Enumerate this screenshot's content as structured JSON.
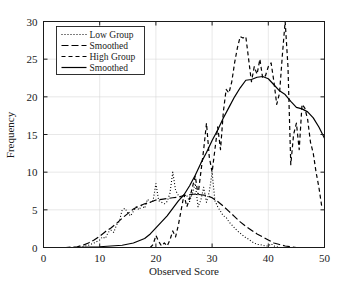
{
  "chart_data": {
    "type": "line",
    "title": "",
    "xlabel": "Observed Score",
    "ylabel": "Frequency",
    "xlim": [
      0,
      50
    ],
    "ylim": [
      0,
      30
    ],
    "xticks": [
      0,
      10,
      20,
      30,
      40,
      50
    ],
    "yticks": [
      0,
      5,
      10,
      15,
      20,
      25,
      30
    ],
    "grid": true,
    "legend_position": "top-left",
    "line_color": "#000000",
    "background_color": "#ffffff",
    "series": [
      {
        "name": "Low Group",
        "style": "dotted",
        "x": [
          0,
          1,
          2,
          3,
          4,
          5,
          6,
          7,
          8,
          9,
          10,
          10.5,
          11,
          11.5,
          12,
          12.5,
          13,
          13.5,
          14,
          14.5,
          15,
          15.5,
          16,
          16.5,
          17,
          17.5,
          18,
          18.5,
          19,
          19.5,
          20,
          20.5,
          21,
          21.5,
          22,
          22.5,
          23,
          23.5,
          24,
          24.5,
          25,
          25.5,
          26,
          26.5,
          27,
          27.5,
          28,
          28.5,
          29,
          29.5,
          30,
          30.5,
          31,
          31.5,
          32,
          32.5,
          33,
          33.5,
          34,
          34.5,
          35,
          35.5,
          36,
          36.5,
          37,
          37.5,
          38,
          38.5,
          39,
          39.5,
          40,
          40.5,
          41,
          42,
          43,
          44,
          45,
          46,
          47,
          48,
          49,
          50
        ],
        "values": [
          0,
          0,
          0,
          0,
          0,
          0,
          0,
          0.1,
          0.3,
          0.6,
          1.0,
          1.4,
          1.2,
          2.0,
          2.3,
          2.0,
          3.0,
          3.5,
          5.0,
          5.2,
          4.6,
          4.2,
          4.8,
          5.4,
          5.0,
          5.6,
          5.2,
          6.4,
          6.0,
          6.2,
          8.5,
          6.2,
          6.0,
          5.8,
          6.1,
          7.2,
          10.0,
          7.6,
          6.9,
          6.6,
          7.0,
          6.9,
          6.1,
          7.2,
          8.5,
          5.4,
          6.3,
          8.0,
          6.0,
          7.4,
          10.0,
          6.2,
          5.4,
          4.8,
          4.2,
          4.0,
          3.4,
          3.0,
          2.6,
          2.2,
          1.9,
          1.6,
          1.3,
          1.1,
          0.8,
          0.6,
          0.4,
          0.4,
          0.3,
          0.2,
          0.2,
          0.5,
          0.2,
          0,
          0,
          0,
          0,
          0,
          0,
          0,
          0,
          0
        ]
      },
      {
        "name": "Smoothed",
        "style": "long-dash",
        "x": [
          0,
          2,
          4,
          6,
          7,
          8,
          9,
          10,
          11,
          12,
          13,
          14,
          15,
          16,
          17,
          18,
          19,
          20,
          21,
          22,
          23,
          24,
          25,
          26,
          27,
          28,
          29,
          30,
          31,
          32,
          33,
          34,
          35,
          36,
          37,
          38,
          39,
          40,
          41,
          42,
          43,
          44,
          45,
          46,
          48,
          50
        ],
        "values": [
          0,
          0,
          0,
          0.1,
          0.3,
          0.6,
          1.0,
          1.5,
          2.1,
          2.6,
          3.2,
          3.9,
          4.5,
          5.1,
          5.5,
          5.8,
          6.0,
          6.3,
          6.4,
          6.5,
          6.6,
          6.7,
          6.9,
          7.0,
          7.1,
          7.0,
          6.9,
          6.6,
          6.1,
          5.5,
          4.8,
          4.1,
          3.4,
          2.8,
          2.3,
          1.8,
          1.4,
          1.0,
          0.6,
          0.4,
          0.2,
          0.1,
          0,
          0,
          0,
          0
        ]
      },
      {
        "name": "High Group",
        "style": "dash",
        "x": [
          19,
          19.5,
          20,
          20.5,
          21,
          21.5,
          22,
          22.5,
          23,
          23.5,
          24,
          24.5,
          25,
          25.5,
          26,
          26.5,
          27,
          27.5,
          28,
          28.5,
          29,
          29.5,
          30,
          30.5,
          31,
          31.5,
          32,
          32.5,
          33,
          33.5,
          34,
          34.5,
          35,
          35.5,
          36,
          36.5,
          37,
          37.5,
          38,
          38.5,
          39,
          39.5,
          40,
          40.5,
          41,
          41.5,
          42,
          42.5,
          43,
          43.5,
          44,
          44.5,
          45,
          45.5,
          46,
          46.5,
          47,
          47.5,
          48,
          48.5,
          49,
          49.5,
          50
        ],
        "values": [
          0,
          0.4,
          1.6,
          0.8,
          0.2,
          0.6,
          0.2,
          1.0,
          2.2,
          1.4,
          3.0,
          5.0,
          7.0,
          5.4,
          6.5,
          8.0,
          9.5,
          7.0,
          10.0,
          13.0,
          16.5,
          12.0,
          10.0,
          13.0,
          16.0,
          13.0,
          18.0,
          21.0,
          20.5,
          22.0,
          24.5,
          26.5,
          28.0,
          27.8,
          28.0,
          25.0,
          22.0,
          24.0,
          23.0,
          25.0,
          22.5,
          22.8,
          24.0,
          24.5,
          22.0,
          19.0,
          20.5,
          25.5,
          30.0,
          24.0,
          11.0,
          15.0,
          16.5,
          13.0,
          19.0,
          18.5,
          17.0,
          14.0,
          12.5,
          10.0,
          8.0,
          5.5,
          5.5
        ]
      },
      {
        "name": "Smoothed",
        "style": "solid",
        "x": [
          0,
          5,
          10,
          14,
          16,
          18,
          19,
          20,
          21,
          22,
          23,
          24,
          25,
          26,
          27,
          28,
          29,
          30,
          31,
          32,
          33,
          34,
          35,
          36,
          37,
          38,
          39,
          40,
          41,
          42,
          43,
          44,
          45,
          46,
          47,
          48,
          49,
          50
        ],
        "values": [
          0,
          0,
          0.1,
          0.3,
          0.6,
          1.2,
          1.8,
          2.6,
          3.4,
          4.2,
          5.2,
          6.2,
          7.0,
          8.2,
          9.6,
          11.2,
          12.6,
          14.2,
          15.6,
          17.2,
          18.6,
          20.0,
          21.2,
          22.2,
          22.3,
          22.6,
          22.7,
          22.4,
          21.6,
          20.8,
          20.3,
          19.4,
          18.6,
          18.4,
          18.0,
          17.2,
          16.0,
          14.5
        ]
      }
    ]
  },
  "legend": {
    "items": [
      {
        "label": "Low Group",
        "style": "dotted"
      },
      {
        "label": "Smoothed",
        "style": "long-dash"
      },
      {
        "label": "High Group",
        "style": "dash"
      },
      {
        "label": "Smoothed",
        "style": "solid"
      }
    ]
  }
}
